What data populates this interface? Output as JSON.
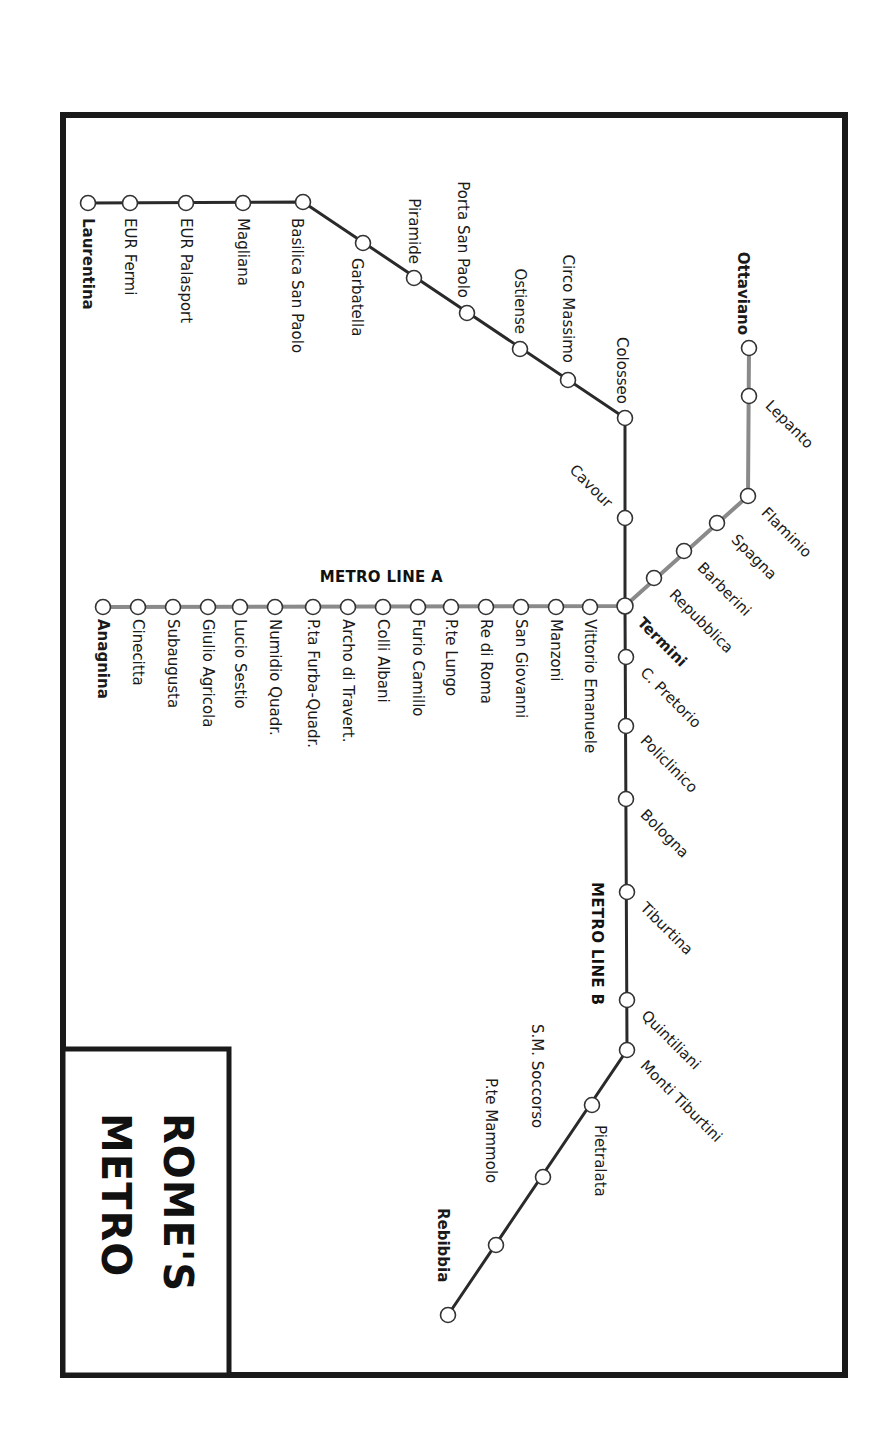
{
  "title": {
    "line1": "ROME'S",
    "line2": "METRO"
  },
  "colors": {
    "line_a": "#8a8a8a",
    "line_b": "#2a2a2a",
    "frame": "#1a1a1a",
    "station_fill": "#ffffff"
  },
  "lines": {
    "line_a": {
      "label": "METRO LINE A",
      "stations": [
        {
          "name": "Ottaviano",
          "terminus": true
        },
        {
          "name": "Lepanto"
        },
        {
          "name": "Flaminio"
        },
        {
          "name": "Spagna"
        },
        {
          "name": "Barberini"
        },
        {
          "name": "Repubblica"
        },
        {
          "name": "Termini",
          "interchange": true
        },
        {
          "name": "Vittorio Emanuele"
        },
        {
          "name": "Manzoni"
        },
        {
          "name": "San Giovanni"
        },
        {
          "name": "Re di Roma"
        },
        {
          "name": "P.te Lungo"
        },
        {
          "name": "Furio Camillo"
        },
        {
          "name": "Colli Albani"
        },
        {
          "name": "Archo di Travert."
        },
        {
          "name": "P.ta Furba-Quadr."
        },
        {
          "name": "Numidio Quadr."
        },
        {
          "name": "Lucio Sestio"
        },
        {
          "name": "Giulio Agricola"
        },
        {
          "name": "Subaugusta"
        },
        {
          "name": "Cinecitta"
        },
        {
          "name": "Anagnina",
          "terminus": true
        }
      ]
    },
    "line_b": {
      "label": "METRO LINE B",
      "stations": [
        {
          "name": "Laurentina",
          "terminus": true
        },
        {
          "name": "EUR Fermi"
        },
        {
          "name": "EUR Palasport"
        },
        {
          "name": "Magliana"
        },
        {
          "name": "Basilica San Paolo"
        },
        {
          "name": "Garbatella"
        },
        {
          "name": "Piramide"
        },
        {
          "name": "Porta San Paolo"
        },
        {
          "name": "Ostiense"
        },
        {
          "name": "Circo Massimo"
        },
        {
          "name": "Colosseo"
        },
        {
          "name": "Cavour"
        },
        {
          "name": "Termini",
          "interchange": true
        },
        {
          "name": "C. Pretorio"
        },
        {
          "name": "Policlinico"
        },
        {
          "name": "Bologna"
        },
        {
          "name": "Tiburtina"
        },
        {
          "name": "Quintiliani"
        },
        {
          "name": "Monti Tiburtini"
        },
        {
          "name": "Pietralata"
        },
        {
          "name": "S.M. Soccorso"
        },
        {
          "name": "P.te Mammolo"
        },
        {
          "name": "Rebibbia",
          "terminus": true
        }
      ]
    }
  }
}
